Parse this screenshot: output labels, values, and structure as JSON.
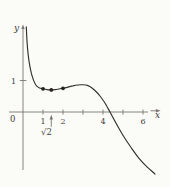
{
  "figure": {
    "background": "#fbfbf8",
    "curve_color": "#33312e",
    "axis_color": "#7a7671",
    "label_color": "#45423e",
    "dot_color": "#24211e"
  },
  "chart_data": {
    "type": "line",
    "title": "",
    "xlabel": "x",
    "ylabel": "y",
    "origin_label": "0",
    "grid": false,
    "legend": false,
    "x_range": [
      0,
      6.8
    ],
    "y_range": [
      -2.2,
      2.9
    ],
    "x_ticks": [
      {
        "value": 1,
        "label": "1"
      },
      {
        "value": 2,
        "label": "2"
      },
      {
        "value": 3,
        "label": ""
      },
      {
        "value": 4,
        "label": "4"
      },
      {
        "value": 5,
        "label": ""
      },
      {
        "value": 6,
        "label": "6"
      }
    ],
    "y_ticks": [
      {
        "value": 1,
        "label": "1"
      }
    ],
    "annotation": {
      "text": "√2",
      "x": 1.414,
      "pointer": "up-arrow"
    },
    "x_axis_crossing": 4.35,
    "series": [
      {
        "name": "curve",
        "points": [
          [
            0.165,
            2.7
          ],
          [
            0.2,
            2.25
          ],
          [
            0.25,
            1.87
          ],
          [
            0.325,
            1.52
          ],
          [
            0.425,
            1.21
          ],
          [
            0.55,
            0.97
          ],
          [
            0.675,
            0.83
          ],
          [
            0.825,
            0.765
          ],
          [
            1.0,
            0.737
          ],
          [
            1.2,
            0.711
          ],
          [
            1.414,
            0.702
          ],
          [
            1.6,
            0.711
          ],
          [
            1.8,
            0.73
          ],
          [
            2.0,
            0.752
          ],
          [
            2.25,
            0.79
          ],
          [
            2.5,
            0.829
          ],
          [
            2.75,
            0.857
          ],
          [
            3.0,
            0.863
          ],
          [
            3.25,
            0.838
          ],
          [
            3.45,
            0.762
          ],
          [
            3.65,
            0.651
          ],
          [
            3.85,
            0.508
          ],
          [
            4.05,
            0.333
          ],
          [
            4.2,
            0.175
          ],
          [
            4.35,
            0.0
          ],
          [
            4.55,
            -0.238
          ],
          [
            4.8,
            -0.524
          ],
          [
            5.1,
            -0.84
          ],
          [
            5.45,
            -1.17
          ],
          [
            5.8,
            -1.47
          ],
          [
            6.2,
            -1.74
          ],
          [
            6.6,
            -1.97
          ]
        ]
      }
    ],
    "marked_points": [
      {
        "x": 1.0,
        "y": 0.737
      },
      {
        "x": 1.414,
        "y": 0.702
      },
      {
        "x": 2.0,
        "y": 0.752
      }
    ]
  }
}
